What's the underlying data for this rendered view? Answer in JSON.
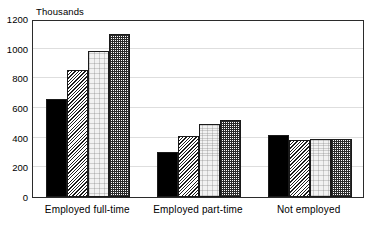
{
  "chart_data": {
    "type": "bar",
    "title": "",
    "subtitle": "",
    "xlabel": "",
    "ylabel": "",
    "unit_caption": "Thousands",
    "categories": [
      "Employed full-time",
      "Employed part-time",
      "Not employed"
    ],
    "series": [
      {
        "name": "Series 1",
        "pattern": "solid-black",
        "values": [
          660,
          305,
          415
        ]
      },
      {
        "name": "Series 2",
        "pattern": "diagonal-hatch",
        "values": [
          855,
          412,
          385
        ]
      },
      {
        "name": "Series 3",
        "pattern": "light-stipple",
        "values": [
          985,
          495,
          392
        ]
      },
      {
        "name": "Series 4",
        "pattern": "dark-check",
        "values": [
          1100,
          520,
          392
        ]
      }
    ],
    "ylim": [
      0,
      1200
    ],
    "yticks": [
      0,
      200,
      400,
      600,
      800,
      1000,
      1200
    ],
    "ytick_labels": [
      "0",
      "200",
      "400",
      "600",
      "800",
      "1000",
      "1200"
    ],
    "grid": true,
    "grid_axis": "y",
    "legend": false,
    "legend_position": "none",
    "colors": {
      "solid-black": "#000000",
      "diagonal-hatch": "#1c1c1c",
      "light-stipple": "#f2f2f2",
      "dark-check": "#2a2a2a",
      "axis": "#2b2b2b",
      "gridline": "#dedede",
      "background": "#ffffff"
    }
  }
}
